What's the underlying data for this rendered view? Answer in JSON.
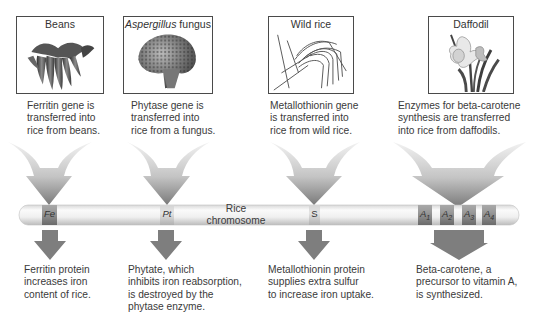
{
  "sources": [
    {
      "id": "beans",
      "title": "Beans",
      "title_italic": "",
      "title_rest": "Beans",
      "gene_text": [
        "Ferritin gene is",
        "transferred into",
        "rice from beans."
      ]
    },
    {
      "id": "aspergillus",
      "title": "Aspergillus fungus",
      "title_italic": "Aspergillus",
      "title_rest": " fungus",
      "gene_text": [
        "Phytase gene is",
        "transferred into",
        "rice from a fungus."
      ]
    },
    {
      "id": "wild-rice",
      "title": "Wild rice",
      "title_italic": "",
      "title_rest": "Wild rice",
      "gene_text": [
        "Metallothionin gene",
        "is transferred into",
        "rice from wild rice."
      ]
    },
    {
      "id": "daffodil",
      "title": "Daffodil",
      "title_italic": "",
      "title_rest": "Daffodil",
      "gene_text": [
        "Enzymes for beta-carotene",
        "synthesis are transferred",
        "into rice from daffodils."
      ]
    }
  ],
  "chromosome": {
    "label_line1": "Rice",
    "label_line2": "chromosome",
    "bands": [
      {
        "symbol": "Fe",
        "sub": ""
      },
      {
        "symbol": "Pt",
        "sub": ""
      },
      {
        "symbol": "S",
        "sub": ""
      },
      {
        "symbol": "A",
        "sub": "1"
      },
      {
        "symbol": "A",
        "sub": "2"
      },
      {
        "symbol": "A",
        "sub": "3"
      },
      {
        "symbol": "A",
        "sub": "4"
      }
    ]
  },
  "outcomes": [
    {
      "id": "ferritin",
      "text": [
        "Ferritin protein",
        "increases iron",
        "content of rice."
      ]
    },
    {
      "id": "phytate",
      "text": [
        "Phytate, which",
        "inhibits iron reabsorption,",
        "is destroyed by the",
        "phytase enzyme."
      ]
    },
    {
      "id": "metallothionin",
      "text": [
        "Metallothionin protein",
        "supplies extra sulfur",
        "to increase iron uptake."
      ]
    },
    {
      "id": "beta-carotene",
      "text": [
        "Beta-carotene, a",
        "precursor to vitamin A,",
        "is synthesized."
      ]
    }
  ],
  "colors": {
    "arrow_dark": "#7a7a7a",
    "arrow_light": "#ededed",
    "chromosome_body": "#f2f2f2",
    "band_dark": "#8c8c8c",
    "band_light": "#cfcfcf",
    "box_border": "#4a4a4a"
  }
}
